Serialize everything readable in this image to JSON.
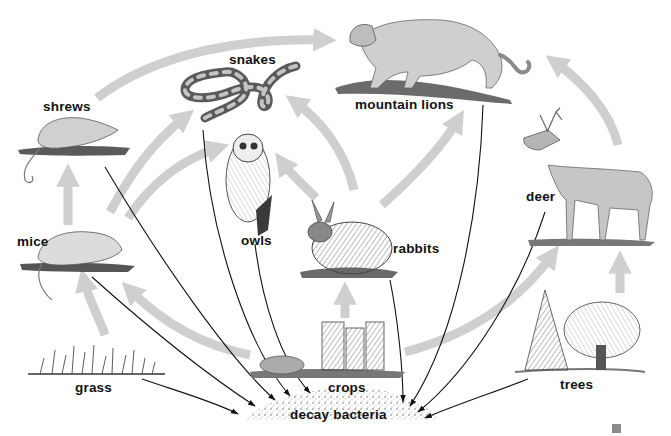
{
  "diagram": {
    "type": "food web",
    "colors": {
      "energy_arrow": "#cfcfcf",
      "decay_arrow": "#111111",
      "ink": "#1a1a1a",
      "background": "#ffffff"
    },
    "organisms": [
      {
        "id": "shrews",
        "label": "shrews"
      },
      {
        "id": "snakes",
        "label": "snakes"
      },
      {
        "id": "mountain_lions",
        "label": "mountain lions"
      },
      {
        "id": "owls",
        "label": "owls"
      },
      {
        "id": "mice",
        "label": "mice"
      },
      {
        "id": "rabbits",
        "label": "rabbits"
      },
      {
        "id": "deer",
        "label": "deer"
      },
      {
        "id": "grass",
        "label": "grass"
      },
      {
        "id": "crops",
        "label": "crops"
      },
      {
        "id": "trees",
        "label": "trees"
      },
      {
        "id": "decay_bacteria",
        "label": "decay bacteria"
      }
    ],
    "feeding_arrows": [
      {
        "from": "grass",
        "to": "mice"
      },
      {
        "from": "crops",
        "to": "mice"
      },
      {
        "from": "mice",
        "to": "shrews"
      },
      {
        "from": "mice",
        "to": "snakes"
      },
      {
        "from": "mice",
        "to": "owls"
      },
      {
        "from": "shrews",
        "to": "mountain_lions"
      },
      {
        "from": "crops",
        "to": "rabbits"
      },
      {
        "from": "rabbits",
        "to": "owls"
      },
      {
        "from": "rabbits",
        "to": "snakes"
      },
      {
        "from": "rabbits",
        "to": "mountain_lions"
      },
      {
        "from": "crops",
        "to": "deer"
      },
      {
        "from": "trees",
        "to": "deer"
      },
      {
        "from": "deer",
        "to": "mountain_lions"
      }
    ],
    "decay_arrows": [
      {
        "from": "grass",
        "to": "decay_bacteria"
      },
      {
        "from": "mice",
        "to": "decay_bacteria"
      },
      {
        "from": "shrews",
        "to": "decay_bacteria"
      },
      {
        "from": "snakes",
        "to": "decay_bacteria"
      },
      {
        "from": "owls",
        "to": "decay_bacteria"
      },
      {
        "from": "rabbits",
        "to": "decay_bacteria"
      },
      {
        "from": "mountain_lions",
        "to": "decay_bacteria"
      },
      {
        "from": "deer",
        "to": "decay_bacteria"
      },
      {
        "from": "trees",
        "to": "decay_bacteria"
      }
    ]
  }
}
